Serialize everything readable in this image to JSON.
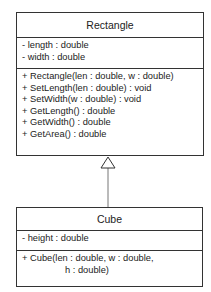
{
  "diagram": {
    "type": "UML class diagram",
    "relationship": "generalization",
    "classes": [
      {
        "name": "Rectangle",
        "attributes": [
          "- length : double",
          "- width : double"
        ],
        "operations": [
          "+ Rectangle(len : double, w : double)",
          "+ SetLength(len : double) : void",
          "+ SetWidth(w : double) : void",
          "+ GetLength() : double",
          "+ GetWidth() : double",
          "+ GetArea() : double"
        ]
      },
      {
        "name": "Cube",
        "attributes": [
          "- height : double"
        ],
        "operations": [
          "+ Cube(len : double, w : double,",
          "h : double)"
        ]
      }
    ],
    "edges": [
      {
        "from": "Cube",
        "to": "Rectangle",
        "kind": "inheritance",
        "arrow": "hollow-triangle"
      }
    ],
    "colors": {
      "line": "#333333",
      "background": "#ffffff",
      "text": "#222222"
    }
  }
}
